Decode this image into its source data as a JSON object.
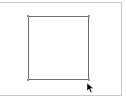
{
  "canvas": {
    "background": "#ffffff",
    "frame_border_color": "#c8c8c8"
  },
  "shape": {
    "type": "rectangle",
    "stroke_color": "#6e6e6e",
    "fill": "none",
    "x": 28,
    "y": 16,
    "width": 61,
    "height": 64
  },
  "cursor": {
    "icon": "arrow-pointer-icon",
    "x": 87,
    "y": 78,
    "color": "#000000"
  }
}
